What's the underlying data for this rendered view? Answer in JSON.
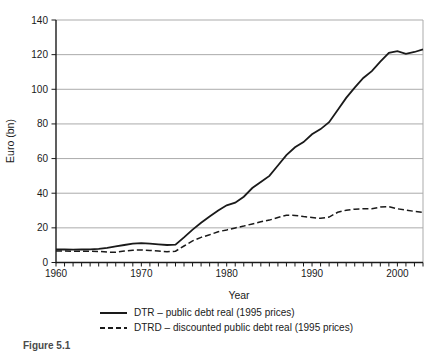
{
  "figure": {
    "caption": "Figure 5.1"
  },
  "chart_data": {
    "type": "line",
    "title": "",
    "xlabel": "Year",
    "ylabel": "Euro (bn)",
    "x_range": [
      1960,
      2003
    ],
    "y_range": [
      0,
      140
    ],
    "y_ticks": [
      0,
      20,
      40,
      60,
      80,
      100,
      120,
      140
    ],
    "x_tick_labels": [
      "1960",
      "1970",
      "1980",
      "1990",
      "2000"
    ],
    "x_minor_tick_interval": 1,
    "grid": "horizontal",
    "frame": true,
    "legend_position": "bottom",
    "line_color": "#1a1a1a",
    "grid_color": "#ababab",
    "years": [
      1960,
      1961,
      1962,
      1963,
      1964,
      1965,
      1966,
      1967,
      1968,
      1969,
      1970,
      1971,
      1972,
      1973,
      1974,
      1975,
      1976,
      1977,
      1978,
      1979,
      1980,
      1981,
      1982,
      1983,
      1984,
      1985,
      1986,
      1987,
      1988,
      1989,
      1990,
      1991,
      1992,
      1993,
      1994,
      1995,
      1996,
      1997,
      1998,
      1999,
      2000,
      2001,
      2002,
      2003
    ],
    "series": [
      {
        "id": "DTR",
        "label": "DTR – public debt real (1995 prices)",
        "style": "solid",
        "color": "#1a1a1a",
        "values": [
          7.5,
          7.5,
          7.4,
          7.5,
          7.6,
          7.9,
          8.5,
          9.3,
          10.1,
          10.9,
          11.2,
          10.9,
          10.5,
          10.1,
          10.3,
          14.5,
          19,
          23,
          26.5,
          30,
          33,
          34.5,
          38,
          43,
          46.5,
          50,
          56,
          62,
          66.5,
          69.5,
          74,
          77,
          81,
          88,
          95,
          101,
          106.5,
          110.5,
          116,
          121,
          122,
          120.5,
          121.5,
          123
        ]
      },
      {
        "id": "DTRD",
        "label": "DTRD – discounted public debt real (1995 prices)",
        "style": "dashed",
        "color": "#1a1a1a",
        "values": [
          6.6,
          6.6,
          6.5,
          6.5,
          6.5,
          6.4,
          6.0,
          5.9,
          6.6,
          7.1,
          7.2,
          7.0,
          6.6,
          6.2,
          6.5,
          9.5,
          12.5,
          14.5,
          16,
          17.8,
          18.8,
          20,
          21,
          22.3,
          23.5,
          24.5,
          26,
          27.3,
          27.2,
          26.5,
          26,
          25.5,
          26.2,
          29,
          30.2,
          30.8,
          31,
          31,
          32,
          32.2,
          31,
          30.3,
          29.5,
          29
        ]
      }
    ]
  }
}
